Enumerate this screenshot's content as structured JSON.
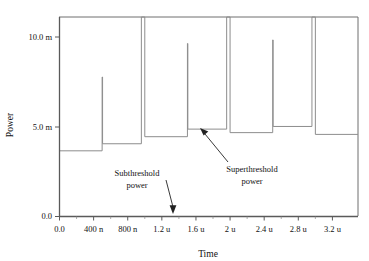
{
  "chart_data": {
    "type": "line",
    "title": "",
    "xlabel": "Time",
    "ylabel": "Power",
    "xlim": [
      0,
      3.5e-06
    ],
    "ylim": [
      0,
      0.0113
    ],
    "grid": false,
    "legend": null,
    "y_ticks": [
      {
        "value": 0.0,
        "label": "0.0"
      },
      {
        "value": 0.005,
        "label": "5.0 m"
      },
      {
        "value": 0.01,
        "label": "10.0 m"
      }
    ],
    "x_ticks": [
      {
        "value": 0.0,
        "label": "0.0"
      },
      {
        "value": 4e-07,
        "label": "400 n"
      },
      {
        "value": 8e-07,
        "label": "800 n"
      },
      {
        "value": 1.2e-06,
        "label": "1.2 u"
      },
      {
        "value": 1.6e-06,
        "label": "1.6 u"
      },
      {
        "value": 2e-06,
        "label": "2 u"
      },
      {
        "value": 2.4e-06,
        "label": "2.4 u"
      },
      {
        "value": 2.8e-06,
        "label": "2.8 u"
      },
      {
        "value": 3.2e-06,
        "label": "3.2 u"
      }
    ],
    "series": [
      {
        "name": "power",
        "units": {
          "x": "s",
          "y": "W"
        },
        "description": "Subthreshold plateau power punctuated by superthreshold spikes; wide blocks are clipped by the top of the plot frame.",
        "points": [
          [
            0.0,
            0.0113
          ],
          [
            0.0,
            0.00372
          ],
          [
            5e-07,
            0.00372
          ],
          [
            5e-07,
            0.0079
          ],
          [
            5.05e-07,
            0.0079
          ],
          [
            5.05e-07,
            0.00412
          ],
          [
            9.6e-07,
            0.00412
          ],
          [
            9.6e-07,
            0.0113
          ],
          [
            1e-06,
            0.0113
          ],
          [
            1e-06,
            0.00452
          ],
          [
            1.5e-06,
            0.00452
          ],
          [
            1.5e-06,
            0.0098
          ],
          [
            1.505e-06,
            0.0098
          ],
          [
            1.505e-06,
            0.00495
          ],
          [
            1.96e-06,
            0.00495
          ],
          [
            1.96e-06,
            0.0113
          ],
          [
            2e-06,
            0.0113
          ],
          [
            2e-06,
            0.00475
          ],
          [
            2.5e-06,
            0.00475
          ],
          [
            2.5e-06,
            0.01
          ],
          [
            2.505e-06,
            0.01
          ],
          [
            2.505e-06,
            0.0051
          ],
          [
            2.96e-06,
            0.0051
          ],
          [
            2.96e-06,
            0.0113
          ],
          [
            3e-06,
            0.0113
          ],
          [
            3e-06,
            0.00465
          ],
          [
            3.5e-06,
            0.00465
          ]
        ],
        "plateaus": [
          {
            "t_start": 0.0,
            "t_end": 5e-07,
            "value": 0.00372
          },
          {
            "t_start": 5.05e-07,
            "t_end": 9.6e-07,
            "value": 0.00412
          },
          {
            "t_start": 1e-06,
            "t_end": 1.5e-06,
            "value": 0.00452
          },
          {
            "t_start": 1.505e-06,
            "t_end": 1.96e-06,
            "value": 0.00495
          },
          {
            "t_start": 2e-06,
            "t_end": 2.5e-06,
            "value": 0.00475
          },
          {
            "t_start": 2.505e-06,
            "t_end": 2.96e-06,
            "value": 0.0051
          },
          {
            "t_start": 3e-06,
            "t_end": 3.5e-06,
            "value": 0.00465
          }
        ],
        "spikes": [
          {
            "t": 5e-07,
            "peak": 0.0079,
            "clipped": false
          },
          {
            "t": 1.5e-06,
            "peak": 0.0098,
            "clipped": false
          },
          {
            "t": 2.5e-06,
            "peak": 0.01,
            "clipped": false
          }
        ],
        "clipped_blocks": [
          {
            "t_start": 9.6e-07,
            "t_end": 1e-06
          },
          {
            "t_start": 1.96e-06,
            "t_end": 2e-06
          },
          {
            "t_start": 2.96e-06,
            "t_end": 3e-06
          }
        ]
      }
    ],
    "annotations": [
      {
        "id": "subthreshold",
        "text_line1": "Subthreshold",
        "text_line2": "power",
        "target": {
          "x": 1.2e-06,
          "y": 0.0002
        }
      },
      {
        "id": "superthreshold",
        "text_line1": "Superthreshold",
        "text_line2": "power",
        "target": {
          "x": 1.82e-06,
          "y": 0.00495
        }
      }
    ]
  },
  "axes": {
    "y_title": "Power",
    "x_title": "Time",
    "y_tick_labels": [
      "10.0 m",
      "5.0 m",
      "0.0"
    ],
    "x_tick_labels": [
      "0.0",
      "400 n",
      "800 n",
      "1.2 u",
      "1.6 u",
      "2 u",
      "2.4 u",
      "2.8 u",
      "3.2 u"
    ]
  },
  "annotations": {
    "subthreshold": {
      "line1": "Subthreshold",
      "line2": "power"
    },
    "superthreshold": {
      "line1": "Superthreshold",
      "line2": "power"
    }
  },
  "colors": {
    "background": "#ffffff",
    "series": "#8d8d8d",
    "frame": "#6f6f6f",
    "axis": "#5a5a5a",
    "text": "#111111",
    "annotation_arrow": "#222222"
  }
}
